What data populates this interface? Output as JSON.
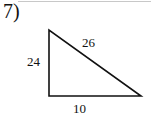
{
  "problem": {
    "number": "7)",
    "figure": "right-triangle",
    "sides": {
      "hypotenuse": "26",
      "vertical_leg": "24",
      "horizontal_leg": "10"
    }
  }
}
